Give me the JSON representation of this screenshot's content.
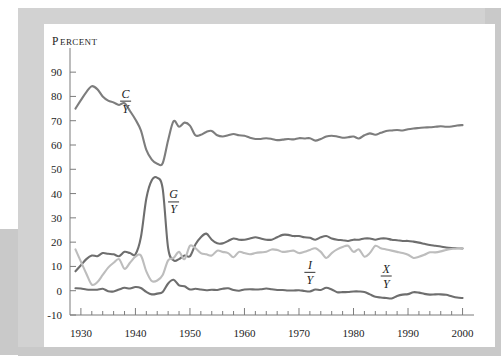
{
  "figure": {
    "unit_label": "Percent",
    "unit_label_first": "P",
    "unit_label_rest": "ERCENT",
    "background": "#ffffff",
    "frame_color": "#d2d2d2",
    "block_color": "#c9c9c9"
  },
  "chart_data": {
    "type": "line",
    "title": "",
    "subtitle": "",
    "xlabel": "",
    "ylabel": "Percent",
    "xlim": [
      1928,
      2001
    ],
    "ylim": [
      -10,
      95
    ],
    "yticks": [
      90,
      80,
      70,
      60,
      50,
      40,
      30,
      20,
      10,
      0,
      -10
    ],
    "ytick_labels": [
      "90",
      "80",
      "70",
      "60",
      "50",
      "40",
      "30",
      "20",
      "10",
      "0",
      "-10"
    ],
    "xticks": [
      1930,
      1940,
      1950,
      1960,
      1970,
      1980,
      1990,
      2000
    ],
    "xtick_labels": [
      "1930",
      "1940",
      "1950",
      "1960",
      "1970",
      "1980",
      "1990",
      "2000"
    ],
    "xminor_step": 2,
    "grid": false,
    "legend_position": "inline-annotations",
    "colors": {
      "consumption": "#7d7d7d",
      "government": "#6e6e6e",
      "investment": "#bdbdbd",
      "netexports": "#6e6e6e"
    },
    "annotations": [
      {
        "name": "consumption-label",
        "numerator": "C",
        "denominator": "Y",
        "x": 1938.2,
        "y": 79.5
      },
      {
        "name": "government-label",
        "numerator": "G",
        "denominator": "Y",
        "x": 1947.0,
        "y": 38.0
      },
      {
        "name": "investment-label",
        "numerator": "I",
        "denominator": "Y",
        "x": 1972.0,
        "y": 9.0
      },
      {
        "name": "netexports-label",
        "numerator": "X",
        "denominator": "Y",
        "x": 1986.0,
        "y": 7.5
      }
    ],
    "x": [
      1929,
      1930,
      1931,
      1932,
      1933,
      1934,
      1935,
      1936,
      1937,
      1938,
      1939,
      1940,
      1941,
      1942,
      1943,
      1944,
      1945,
      1946,
      1947,
      1948,
      1949,
      1950,
      1951,
      1952,
      1953,
      1954,
      1955,
      1956,
      1957,
      1958,
      1959,
      1960,
      1961,
      1962,
      1963,
      1964,
      1965,
      1966,
      1967,
      1968,
      1969,
      1970,
      1971,
      1972,
      1973,
      1974,
      1975,
      1976,
      1977,
      1978,
      1979,
      1980,
      1981,
      1982,
      1983,
      1984,
      1985,
      1986,
      1987,
      1988,
      1989,
      1990,
      1991,
      1992,
      1993,
      1994,
      1995,
      1996,
      1997,
      1998,
      1999,
      2000
    ],
    "series": [
      {
        "name": "C/Y",
        "label": "Consumption share of GDP",
        "color": "#7d7d7d",
        "values": [
          75.0,
          78.5,
          81.8,
          84.2,
          83.0,
          80.0,
          78.3,
          77.5,
          76.5,
          77.2,
          74.0,
          70.5,
          66.0,
          58.0,
          54.0,
          52.3,
          52.5,
          62.0,
          69.8,
          67.5,
          69.2,
          68.0,
          64.0,
          64.2,
          65.4,
          65.8,
          64.0,
          63.5,
          64.0,
          64.5,
          64.0,
          63.8,
          63.0,
          62.5,
          62.5,
          62.8,
          62.5,
          62.0,
          62.2,
          62.5,
          62.3,
          62.8,
          62.7,
          62.8,
          61.8,
          62.5,
          63.5,
          63.8,
          63.5,
          63.0,
          63.2,
          63.5,
          62.7,
          64.0,
          64.8,
          64.2,
          65.0,
          65.8,
          66.0,
          66.2,
          66.0,
          66.5,
          66.8,
          67.0,
          67.2,
          67.3,
          67.5,
          67.7,
          67.5,
          67.6,
          68.0,
          68.2
        ]
      },
      {
        "name": "G/Y",
        "label": "Government purchases share of GDP",
        "color": "#6e6e6e",
        "values": [
          8.0,
          10.5,
          13.0,
          14.5,
          14.2,
          15.5,
          15.2,
          15.0,
          14.2,
          16.0,
          15.5,
          15.0,
          22.0,
          38.0,
          45.5,
          46.5,
          42.0,
          17.5,
          12.5,
          13.0,
          14.5,
          14.2,
          19.0,
          22.0,
          23.5,
          21.0,
          19.5,
          19.5,
          20.5,
          21.5,
          21.0,
          21.0,
          21.5,
          22.0,
          21.5,
          21.0,
          21.0,
          22.0,
          23.0,
          23.0,
          22.5,
          22.5,
          22.0,
          21.8,
          21.0,
          22.0,
          22.5,
          21.5,
          21.0,
          20.8,
          20.5,
          21.0,
          21.0,
          21.5,
          21.5,
          21.0,
          21.5,
          21.5,
          21.0,
          20.8,
          20.5,
          20.5,
          20.2,
          19.8,
          19.3,
          18.8,
          18.5,
          18.2,
          17.8,
          17.6,
          17.5,
          17.4
        ]
      },
      {
        "name": "I/Y",
        "label": "Investment share of GDP",
        "color": "#bdbdbd",
        "values": [
          17.0,
          12.0,
          7.0,
          2.5,
          3.5,
          6.5,
          9.5,
          11.5,
          13.0,
          9.0,
          11.5,
          14.0,
          14.5,
          8.0,
          4.0,
          4.2,
          6.5,
          12.5,
          13.5,
          16.0,
          13.0,
          18.5,
          17.5,
          15.5,
          15.0,
          14.5,
          16.5,
          16.0,
          15.5,
          13.8,
          16.0,
          15.5,
          15.0,
          15.5,
          15.8,
          16.0,
          17.0,
          16.8,
          16.0,
          16.2,
          16.5,
          15.5,
          16.0,
          16.8,
          17.5,
          16.0,
          13.5,
          15.5,
          17.0,
          18.0,
          18.5,
          16.0,
          17.0,
          14.0,
          15.5,
          18.5,
          17.5,
          17.0,
          16.5,
          16.0,
          15.5,
          14.8,
          13.5,
          14.0,
          14.8,
          15.8,
          15.8,
          16.2,
          16.8,
          17.2,
          17.5,
          17.5
        ]
      },
      {
        "name": "X/Y",
        "label": "Net exports share of GDP",
        "color": "#6e6e6e",
        "values": [
          1.0,
          0.9,
          0.5,
          0.4,
          0.4,
          0.8,
          -0.2,
          -0.3,
          0.5,
          1.2,
          0.9,
          1.5,
          1.1,
          -0.5,
          -1.5,
          -1.2,
          -0.5,
          3.0,
          4.5,
          2.2,
          1.8,
          0.5,
          0.8,
          0.5,
          0.2,
          0.4,
          0.3,
          0.8,
          1.0,
          0.3,
          0.0,
          0.5,
          0.6,
          0.5,
          0.6,
          0.9,
          0.6,
          0.3,
          0.3,
          0.1,
          0.1,
          0.2,
          -0.1,
          -0.3,
          0.5,
          0.3,
          1.2,
          0.5,
          -0.6,
          -0.6,
          -0.5,
          -0.3,
          -0.3,
          -0.5,
          -1.5,
          -2.5,
          -2.8,
          -3.0,
          -3.2,
          -2.2,
          -1.6,
          -1.4,
          -0.6,
          -0.8,
          -1.3,
          -1.6,
          -1.5,
          -1.5,
          -1.7,
          -2.3,
          -2.8,
          -3.0
        ]
      }
    ]
  }
}
